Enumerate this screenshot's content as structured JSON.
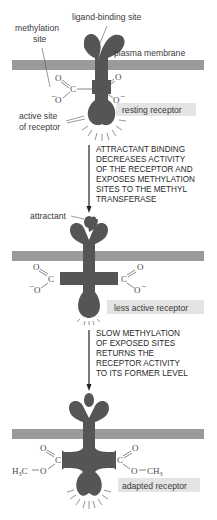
{
  "diagram": {
    "type": "receptor adaptation by methylation",
    "colors": {
      "receptor": "#555555",
      "membrane": "#9a9a9a",
      "label_box": "#e4e4e4",
      "text": "#2a2a2a"
    },
    "stage1": {
      "labels": {
        "ligand_binding_site": "ligand-binding site",
        "methylation_site_line1": "methylation",
        "methylation_site_line2": "site",
        "plasma_membrane": "plasma membrane",
        "active_site_line1": "active site",
        "active_site_line2": "of receptor"
      },
      "state_label": "resting receptor",
      "groups": {
        "left": {
          "o_top": "O",
          "c": "C",
          "o_bottom": "O",
          "charge": "−"
        },
        "right": {
          "o_top": "O",
          "c": "C",
          "o_bottom": "O",
          "charge": "−"
        }
      }
    },
    "transition1": {
      "lines": [
        "ATTRACTANT BINDING",
        "DECREASES ACTIVITY",
        "OF THE RECEPTOR AND",
        "EXPOSES METHYLATION",
        "SITES TO THE METHYL",
        "TRANSFERASE"
      ]
    },
    "stage2": {
      "labels": {
        "attractant": "attractant"
      },
      "state_label": "less active receptor",
      "groups": {
        "left": {
          "o_top": "O",
          "c": "C",
          "o_bottom": "O",
          "charge": "−"
        },
        "right": {
          "o_top": "O",
          "c": "C",
          "o_bottom": "O",
          "charge": "−"
        }
      }
    },
    "transition2": {
      "lines": [
        "SLOW METHYLATION",
        "OF EXPOSED SITES",
        "RETURNS THE",
        "RECEPTOR ACTIVITY",
        "TO ITS FORMER LEVEL"
      ]
    },
    "stage3": {
      "state_label": "adapted receptor",
      "groups": {
        "left": {
          "o_top": "O",
          "c": "C",
          "o_bottom": "O",
          "methyl": "H",
          "methyl_sub": "3",
          "methyl_c": "C"
        },
        "right": {
          "o_top": "O",
          "c": "C",
          "o_bottom": "O",
          "methyl": "CH",
          "methyl_sub": "3"
        }
      }
    }
  }
}
